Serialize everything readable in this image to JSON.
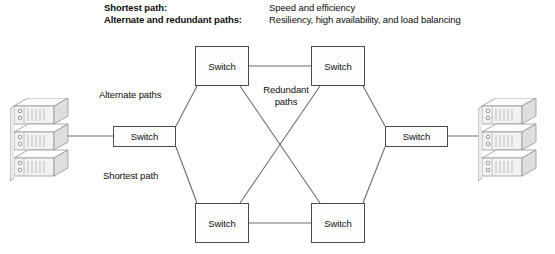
{
  "legend": {
    "rows": [
      {
        "term": "Shortest path:",
        "definition": "Speed and efficiency"
      },
      {
        "term": "Alternate and redundant paths:",
        "definition": "Resiliency, high availability, and load balancing"
      }
    ]
  },
  "diagram": {
    "switches": [
      {
        "id": "sw-tl",
        "label": "Switch"
      },
      {
        "id": "sw-tr",
        "label": "Switch"
      },
      {
        "id": "sw-bl",
        "label": "Switch"
      },
      {
        "id": "sw-br",
        "label": "Switch"
      },
      {
        "id": "sw-l",
        "label": "Switch"
      },
      {
        "id": "sw-r",
        "label": "Switch"
      }
    ],
    "annotations": {
      "alternate": "Alternate paths",
      "shortest": "Shortest path",
      "redundant": "Redundant paths"
    },
    "servers": {
      "left_name": "server-stack-left",
      "right_name": "server-stack-right"
    }
  },
  "colors": {
    "line": "#6e6e6e",
    "box_border": "#4a4a4a",
    "text": "#111111",
    "server_face": "#f2f2f2",
    "server_top": "#fcfcfc",
    "server_side": "#d9d9d9"
  }
}
